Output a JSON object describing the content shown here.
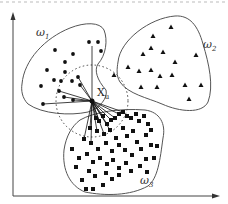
{
  "diagram": {
    "type": "knn-classification-illustration",
    "classes": [
      {
        "id": "w1",
        "label": "ω",
        "subscript": "1",
        "marker": "circle",
        "label_pos": [
          46,
          32
        ]
      },
      {
        "id": "w2",
        "label": "ω",
        "subscript": "2",
        "marker": "triangle",
        "label_pos": [
          205,
          46
        ]
      },
      {
        "id": "w3",
        "label": "ω",
        "subscript": "3",
        "marker": "square",
        "label_pos": [
          146,
          182
        ]
      }
    ],
    "query_point": {
      "label": "X",
      "subscript": "u",
      "x": 92,
      "y": 101
    },
    "neighborhood_circle": {
      "cx": 92,
      "cy": 101,
      "r": 36,
      "style": "dotted"
    },
    "axes": {
      "x_arrow": true,
      "y_arrow": true
    },
    "colors": {
      "stroke": "#555555",
      "marker": "#111111",
      "background": "#ffffff"
    },
    "points": {
      "w1": [
        [
          55,
          50
        ],
        [
          89,
          42
        ],
        [
          98,
          42
        ],
        [
          101,
          51
        ],
        [
          73,
          54
        ],
        [
          65,
          62
        ],
        [
          47,
          70
        ],
        [
          65,
          72
        ],
        [
          72,
          81
        ],
        [
          41,
          86
        ],
        [
          54,
          80
        ],
        [
          61,
          81
        ],
        [
          78,
          77
        ],
        [
          80,
          85
        ],
        [
          64,
          97
        ],
        [
          73,
          100
        ],
        [
          43,
          104
        ],
        [
          59,
          91
        ]
      ],
      "w2": [
        [
          171,
          27
        ],
        [
          153,
          36
        ],
        [
          151,
          48
        ],
        [
          143,
          54
        ],
        [
          163,
          52
        ],
        [
          175,
          62
        ],
        [
          196,
          55
        ],
        [
          128,
          67
        ],
        [
          139,
          71
        ],
        [
          151,
          70
        ],
        [
          160,
          76
        ],
        [
          172,
          75
        ],
        [
          141,
          87
        ],
        [
          157,
          87
        ],
        [
          185,
          85
        ],
        [
          201,
          85
        ],
        [
          189,
          99
        ],
        [
          114,
          75
        ]
      ],
      "w3": [
        [
          96,
          118
        ],
        [
          99,
          121
        ],
        [
          103,
          116
        ],
        [
          107,
          124
        ],
        [
          111,
          120
        ],
        [
          115,
          118
        ],
        [
          119,
          114
        ],
        [
          123,
          112
        ],
        [
          127,
          116
        ],
        [
          131,
          118
        ],
        [
          136,
          114
        ],
        [
          139,
          121
        ],
        [
          144,
          116
        ],
        [
          148,
          124
        ],
        [
          90,
          128
        ],
        [
          97,
          131
        ],
        [
          104,
          134
        ],
        [
          110,
          130
        ],
        [
          116,
          138
        ],
        [
          123,
          128
        ],
        [
          127,
          136
        ],
        [
          133,
          131
        ],
        [
          137,
          142
        ],
        [
          146,
          135
        ],
        [
          151,
          130
        ],
        [
          84,
          139
        ],
        [
          91,
          143
        ],
        [
          98,
          149
        ],
        [
          106,
          143
        ],
        [
          112,
          151
        ],
        [
          119,
          145
        ],
        [
          125,
          150
        ],
        [
          132,
          155
        ],
        [
          141,
          149
        ],
        [
          146,
          159
        ],
        [
          151,
          145
        ],
        [
          72,
          149
        ],
        [
          79,
          158
        ],
        [
          87,
          154
        ],
        [
          93,
          162
        ],
        [
          100,
          158
        ],
        [
          107,
          164
        ],
        [
          113,
          160
        ],
        [
          119,
          168
        ],
        [
          126,
          163
        ],
        [
          131,
          171
        ],
        [
          140,
          166
        ],
        [
          147,
          172
        ],
        [
          89,
          171
        ],
        [
          95,
          176
        ],
        [
          106,
          173
        ],
        [
          112,
          179
        ],
        [
          119,
          175
        ],
        [
          76,
          167
        ],
        [
          82,
          180
        ],
        [
          103,
          185
        ],
        [
          86,
          189
        ],
        [
          93,
          189
        ],
        [
          154,
          158
        ],
        [
          157,
          146
        ]
      ]
    },
    "neighbor_edges_to": [
      [
        59,
        91
      ],
      [
        64,
        97
      ],
      [
        73,
        100
      ],
      [
        43,
        104
      ],
      [
        78,
        77
      ],
      [
        80,
        85
      ],
      [
        92,
        46
      ],
      [
        96,
        118
      ],
      [
        99,
        121
      ],
      [
        103,
        116
      ],
      [
        107,
        124
      ],
      [
        111,
        120
      ],
      [
        115,
        118
      ],
      [
        90,
        128
      ],
      [
        97,
        131
      ],
      [
        104,
        134
      ],
      [
        84,
        139
      ],
      [
        119,
        114
      ],
      [
        123,
        112
      ],
      [
        91,
        143
      ],
      [
        110,
        130
      ]
    ]
  }
}
